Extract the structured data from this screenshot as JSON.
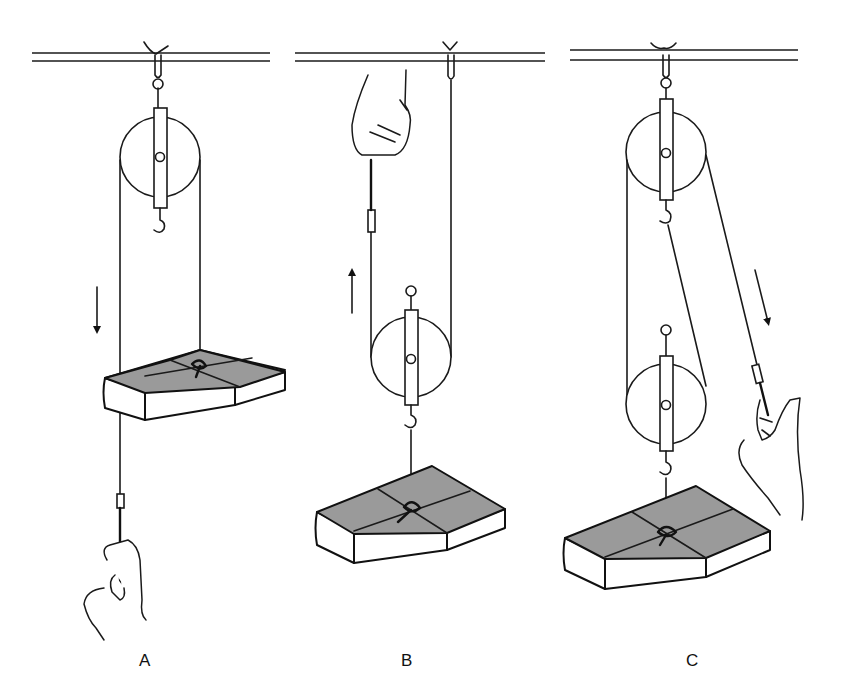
{
  "figure": {
    "colors": {
      "line": "#1a1a1a",
      "book_cover": "#9a9a9a",
      "background": "#ffffff"
    },
    "panels": [
      {
        "label": "A",
        "arrangement": "single fixed pulley",
        "pull_direction": "down",
        "arrow": "down-arrow"
      },
      {
        "label": "B",
        "arrangement": "single movable pulley",
        "pull_direction": "up",
        "arrow": "up-arrow"
      },
      {
        "label": "C",
        "arrangement": "fixed pulley and movable pulley (block and tackle)",
        "pull_direction": "down-right",
        "arrow": "down-arrow"
      }
    ]
  }
}
